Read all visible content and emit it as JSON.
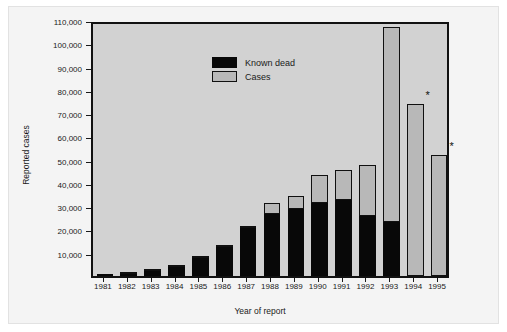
{
  "chart_data": {
    "type": "bar",
    "subtype": "stacked",
    "title": "",
    "xlabel": "Year of report",
    "ylabel": "Reported cases",
    "categories": [
      "1981",
      "1982",
      "1983",
      "1984",
      "1985",
      "1986",
      "1987",
      "1988",
      "1989",
      "1990",
      "1991",
      "1992",
      "1993",
      "1994",
      "1995"
    ],
    "series": [
      {
        "name": "Known dead",
        "color": "#080808",
        "values": [
          200,
          700,
          2000,
          4000,
          7800,
          12500,
          20500,
          26500,
          29000,
          31500,
          32500,
          26000,
          23000,
          0,
          0
        ]
      },
      {
        "name": "Cases",
        "color": "#b8b8b8",
        "values": [
          100,
          200,
          300,
          300,
          400,
          900,
          1000,
          5000,
          5500,
          12000,
          13000,
          21500,
          84000,
          74000,
          52000
        ]
      }
    ],
    "totals": [
      300,
      900,
      2300,
      4300,
      8200,
      13400,
      21500,
      31500,
      34500,
      43500,
      45500,
      47500,
      107000,
      74000,
      52000
    ],
    "ylim": [
      0,
      110000
    ],
    "ytick_values": [
      0,
      10000,
      20000,
      30000,
      40000,
      50000,
      60000,
      70000,
      80000,
      90000,
      100000,
      110000
    ],
    "ytick_labels": [
      "",
      "10,000",
      "20,000",
      "30,000",
      "40,000",
      "50,000",
      "60,000",
      "70,000",
      "80,000",
      "90,000",
      "100,000",
      "110,000"
    ],
    "grid": false,
    "legend_position": "top-left",
    "annotations": [
      {
        "label": "*",
        "category": "1994",
        "note": "asterisk above 1994 bar"
      },
      {
        "label": "*",
        "category": "1995",
        "note": "asterisk above 1995 bar"
      }
    ],
    "plot_background": "#d2d2d2",
    "figure_background": "#f4f4f4"
  },
  "legend": {
    "items": [
      {
        "label": "Known dead"
      },
      {
        "label": "Cases"
      }
    ]
  },
  "axes": {
    "y_title": "Reported cases",
    "x_title": "Year of report"
  }
}
